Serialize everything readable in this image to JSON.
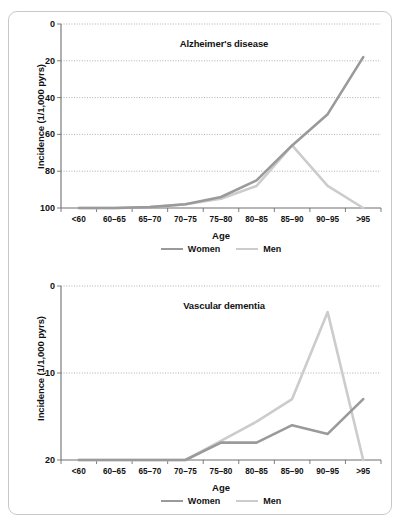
{
  "figure": {
    "panels": [
      {
        "id": "alzheimer",
        "title": "Alzheimer's disease",
        "xlabel": "Age",
        "ylabel": "Incidence (1/1,000 pyrs)",
        "yticks": [
          "100",
          "80",
          "60",
          "40",
          "20",
          "0"
        ],
        "xticks": [
          "<60",
          "60–65",
          "65–70",
          "70–75",
          "75–80",
          "80–85",
          "85–90",
          "90–95",
          ">95"
        ],
        "legend": [
          {
            "label": "Women",
            "color": "#9a9a9a"
          },
          {
            "label": "Men",
            "color": "#cccccc"
          }
        ]
      },
      {
        "id": "vascular",
        "title": "Vascular dementia",
        "xlabel": "Age",
        "ylabel": "Incidence (1/1,000 pyrs)",
        "yticks": [
          "20",
          "10",
          "0"
        ],
        "xticks": [
          "<60",
          "60–65",
          "65–70",
          "70–75",
          "75–80",
          "80–85",
          "85–90",
          "90–95",
          ">95"
        ],
        "legend": [
          {
            "label": "Women",
            "color": "#9a9a9a"
          },
          {
            "label": "Men",
            "color": "#cccccc"
          }
        ]
      }
    ]
  },
  "chart_data": [
    {
      "type": "line",
      "title": "Alzheimer's disease",
      "xlabel": "Age",
      "ylabel": "Incidence (1/1,000 pyrs)",
      "categories": [
        "<60",
        "60–65",
        "65–70",
        "70–75",
        "75–80",
        "80–85",
        "85–90",
        "90–95",
        ">95"
      ],
      "ylim": [
        0,
        100
      ],
      "yticks": [
        0,
        20,
        40,
        60,
        80,
        100
      ],
      "grid": true,
      "legend_position": "bottom",
      "series": [
        {
          "name": "Women",
          "color": "#9a9a9a",
          "values": [
            0,
            0,
            0.5,
            2,
            6,
            15,
            34,
            51,
            82
          ]
        },
        {
          "name": "Men",
          "color": "#cccccc",
          "values": [
            0,
            0,
            0.5,
            2,
            5,
            12,
            34,
            12,
            0
          ]
        }
      ]
    },
    {
      "type": "line",
      "title": "Vascular dementia",
      "xlabel": "Age",
      "ylabel": "Incidence (1/1,000 pyrs)",
      "categories": [
        "<60",
        "60–65",
        "65–70",
        "70–75",
        "75–80",
        "80–85",
        "85–90",
        "90–95",
        ">95"
      ],
      "ylim": [
        0,
        20
      ],
      "yticks": [
        0,
        10,
        20
      ],
      "grid": true,
      "legend_position": "bottom",
      "series": [
        {
          "name": "Women",
          "color": "#9a9a9a",
          "values": [
            0,
            0,
            0,
            0,
            2,
            2,
            4,
            3,
            7
          ]
        },
        {
          "name": "Men",
          "color": "#cccccc",
          "values": [
            0,
            0,
            0,
            0,
            2.2,
            4.4,
            7,
            17,
            0
          ]
        }
      ]
    }
  ]
}
